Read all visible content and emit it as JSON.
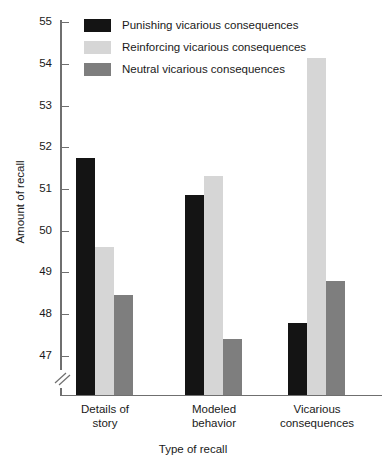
{
  "chart_data": {
    "type": "bar",
    "title": "",
    "xlabel": "Type of recall",
    "ylabel": "Amount of recall",
    "categories": [
      "Details of story",
      "Modeled behavior",
      "Vicarious consequences"
    ],
    "series": [
      {
        "name": "Punishing vicarious consequences",
        "color": "#141414",
        "values": [
          51.75,
          50.85,
          47.8
        ]
      },
      {
        "name": "Reinforcing vicarious consequences",
        "color": "#d6d6d6",
        "values": [
          49.6,
          51.3,
          54.15
        ]
      },
      {
        "name": "Neutral vicarious consequences",
        "color": "#7e7e7e",
        "values": [
          48.45,
          47.4,
          48.8
        ]
      }
    ],
    "ylim": [
      46.6,
      55
    ],
    "yticks": [
      47,
      48,
      49,
      50,
      51,
      52,
      53,
      54,
      55
    ],
    "ytick_labels": [
      "47",
      "48",
      "49",
      "50",
      "51",
      "52",
      "53",
      "54",
      "55"
    ],
    "axis_break": true,
    "grid": false,
    "legend_position": "top-left"
  },
  "legend": {
    "items": [
      {
        "label": "Punishing vicarious consequences",
        "swatch": "punishing"
      },
      {
        "label": "Reinforcing vicarious consequences",
        "swatch": "reinforcing"
      },
      {
        "label": "Neutral vicarious consequences",
        "swatch": "neutral"
      }
    ]
  },
  "axes": {
    "y_title": "Amount of recall",
    "x_title": "Type of recall",
    "y_ticks": [
      "55",
      "54",
      "53",
      "52",
      "51",
      "50",
      "49",
      "48",
      "47"
    ],
    "x_groups": [
      "Details of\nstory",
      "Modeled\nbehavior",
      "Vicarious\nconsequences"
    ]
  },
  "x_group_lines": [
    [
      "Details of",
      "story"
    ],
    [
      "Modeled",
      "behavior"
    ],
    [
      "Vicarious",
      "consequences"
    ]
  ]
}
